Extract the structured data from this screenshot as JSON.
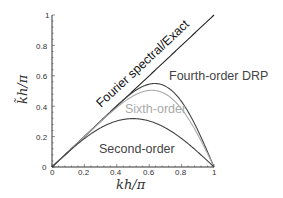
{
  "chart_data": {
    "type": "line",
    "title": "",
    "xlabel": "kh/π",
    "ylabel": "k̃h/π",
    "xlim": [
      0,
      1
    ],
    "ylim": [
      0,
      1
    ],
    "grid": false,
    "x_ticks": [
      "0",
      "0.2",
      "0.4",
      "0.6",
      "0.8",
      "1"
    ],
    "y_ticks": [
      "0",
      "0.2",
      "0.4",
      "0.6",
      "0.8",
      "1"
    ],
    "series": [
      {
        "name": "Fourier spectral/Exact",
        "color": "#222222",
        "x": [
          0,
          1
        ],
        "values": [
          0,
          1
        ]
      },
      {
        "name": "Fourth-order DRP",
        "color": "#444444",
        "x": [
          0,
          0.1,
          0.2,
          0.3,
          0.4,
          0.5,
          0.6,
          0.63,
          0.7,
          0.8,
          0.9,
          1
        ],
        "values": [
          0,
          0.1,
          0.2,
          0.3,
          0.4,
          0.49,
          0.55,
          0.56,
          0.54,
          0.41,
          0.2,
          0
        ]
      },
      {
        "name": "Sixth-order",
        "color": "#aaaaaa",
        "x": [
          0,
          0.1,
          0.2,
          0.3,
          0.4,
          0.5,
          0.6,
          0.65,
          0.7,
          0.8,
          0.9,
          1
        ],
        "values": [
          0,
          0.1,
          0.2,
          0.3,
          0.39,
          0.46,
          0.5,
          0.51,
          0.5,
          0.4,
          0.2,
          0
        ]
      },
      {
        "name": "Second-order",
        "color": "#444444",
        "x": [
          0,
          0.1,
          0.2,
          0.3,
          0.4,
          0.5,
          0.6,
          0.7,
          0.8,
          0.9,
          1
        ],
        "values": [
          0,
          0.098,
          0.187,
          0.258,
          0.303,
          0.318,
          0.303,
          0.258,
          0.187,
          0.098,
          0
        ]
      }
    ],
    "annotations": {
      "exact": "Fourier spectral/Exact",
      "drp": "Fourth-order DRP",
      "sixth": "Sixth-order",
      "second": "Second-order"
    }
  }
}
